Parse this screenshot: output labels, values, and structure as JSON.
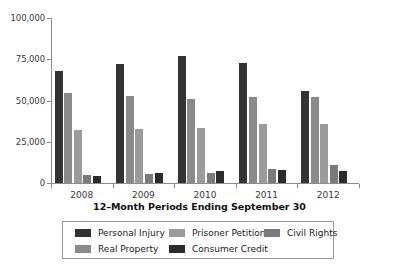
{
  "chart_data": {
    "type": "bar",
    "title": "",
    "xlabel": "12–Month Periods Ending September 30",
    "ylabel": "",
    "ylim": [
      0,
      100000
    ],
    "yticks": [
      0,
      25000,
      50000,
      75000,
      100000
    ],
    "ytick_labels": [
      "0",
      "25,000",
      "50,000",
      "75,000",
      "100,000"
    ],
    "grid": false,
    "legend_position": "bottom",
    "categories": [
      "2008",
      "2009",
      "2010",
      "2011",
      "2012"
    ],
    "series": [
      {
        "name": "Personal Injury",
        "color": "#333333",
        "values": [
          68000,
          72000,
          77000,
          72500,
          55500
        ]
      },
      {
        "name": "Real Property",
        "color": "#8a8a8a",
        "values": [
          54500,
          52500,
          51000,
          52000,
          52000
        ]
      },
      {
        "name": "Prisoner Petitions",
        "color": "#9b9b9b",
        "values": [
          32000,
          33000,
          33500,
          35500,
          35500
        ]
      },
      {
        "name": "Civil Rights",
        "color": "#7a7a7a",
        "values": [
          5000,
          5500,
          6000,
          8500,
          11000
        ]
      },
      {
        "name": "Consumer Credit",
        "color": "#2b2b2b",
        "values": [
          4000,
          6000,
          7000,
          8000,
          7000
        ]
      }
    ],
    "legend_layout": [
      [
        "Personal Injury",
        "Prisoner Petitions",
        "Civil Rights"
      ],
      [
        "Real Property",
        "Consumer Credit"
      ]
    ]
  },
  "axis": {
    "x_title": "12–Month Periods Ending September 30"
  },
  "ytick_labels": {
    "t0": "100,000",
    "t1": "75,000",
    "t2": "50,000",
    "t3": "25,000",
    "t4": "0"
  },
  "xtick_labels": {
    "c0": "2008",
    "c1": "2009",
    "c2": "2010",
    "c3": "2011",
    "c4": "2012"
  },
  "legend": {
    "items": [
      {
        "label": "Personal Injury",
        "color": "#333333"
      },
      {
        "label": "Prisoner Petitions",
        "color": "#9b9b9b"
      },
      {
        "label": "Civil Rights",
        "color": "#7a7a7a"
      },
      {
        "label": "Real Property",
        "color": "#8a8a8a"
      },
      {
        "label": "Consumer Credit",
        "color": "#2b2b2b"
      }
    ]
  }
}
